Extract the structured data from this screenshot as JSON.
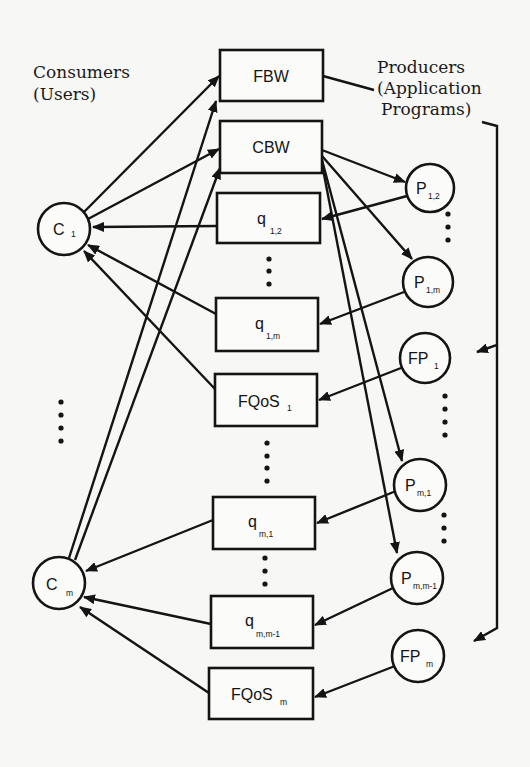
{
  "labels": {
    "consumers_line1": "Consumers",
    "consumers_line2": "(Users)",
    "producers_line1": "Producers",
    "producers_line2": "(Application",
    "producers_line3": "Programs)"
  },
  "consumers": [
    {
      "id": "C1",
      "base": "C",
      "sub": "1"
    },
    {
      "id": "Cm",
      "base": "C",
      "sub": "m"
    }
  ],
  "queues": [
    {
      "id": "FBW",
      "base": "FBW",
      "sub": ""
    },
    {
      "id": "CBW",
      "base": "CBW",
      "sub": ""
    },
    {
      "id": "q12",
      "base": "q",
      "sub": "1,2"
    },
    {
      "id": "q1m",
      "base": "q",
      "sub": "1,m"
    },
    {
      "id": "FQoS1",
      "base": "FQoS",
      "sub": "1"
    },
    {
      "id": "qm1",
      "base": "q",
      "sub": "m,1"
    },
    {
      "id": "qmm1",
      "base": "q",
      "sub": "m,m-1"
    },
    {
      "id": "FQoSm",
      "base": "FQoS",
      "sub": "m"
    }
  ],
  "producers": [
    {
      "id": "P12",
      "base": "P",
      "sub": "1,2"
    },
    {
      "id": "P1m",
      "base": "P",
      "sub": "1,m"
    },
    {
      "id": "FP1",
      "base": "FP",
      "sub": "1"
    },
    {
      "id": "Pm1",
      "base": "P",
      "sub": "m,1"
    },
    {
      "id": "Pmm1",
      "base": "P",
      "sub": "m,m-1"
    },
    {
      "id": "FPm",
      "base": "FP",
      "sub": "m"
    }
  ],
  "edges": [
    {
      "from": "C1",
      "to": "FBW"
    },
    {
      "from": "C1",
      "to": "CBW"
    },
    {
      "from": "Cm",
      "to": "FBW"
    },
    {
      "from": "Cm",
      "to": "CBW"
    },
    {
      "from": "q12",
      "to": "C1"
    },
    {
      "from": "q1m",
      "to": "C1"
    },
    {
      "from": "FQoS1",
      "to": "C1"
    },
    {
      "from": "qm1",
      "to": "Cm"
    },
    {
      "from": "qmm1",
      "to": "Cm"
    },
    {
      "from": "FQoSm",
      "to": "Cm"
    },
    {
      "from": "CBW",
      "to": "P12"
    },
    {
      "from": "CBW",
      "to": "P1m"
    },
    {
      "from": "CBW",
      "to": "Pm1"
    },
    {
      "from": "CBW",
      "to": "Pmm1"
    },
    {
      "from": "P12",
      "to": "q12"
    },
    {
      "from": "P1m",
      "to": "q1m"
    },
    {
      "from": "FP1",
      "to": "FQoS1"
    },
    {
      "from": "Pm1",
      "to": "qm1"
    },
    {
      "from": "Pmm1",
      "to": "qmm1"
    },
    {
      "from": "FPm",
      "to": "FQoSm"
    },
    {
      "from": "FBW",
      "to": "FP1"
    },
    {
      "from": "FBW",
      "to": "FPm"
    }
  ]
}
